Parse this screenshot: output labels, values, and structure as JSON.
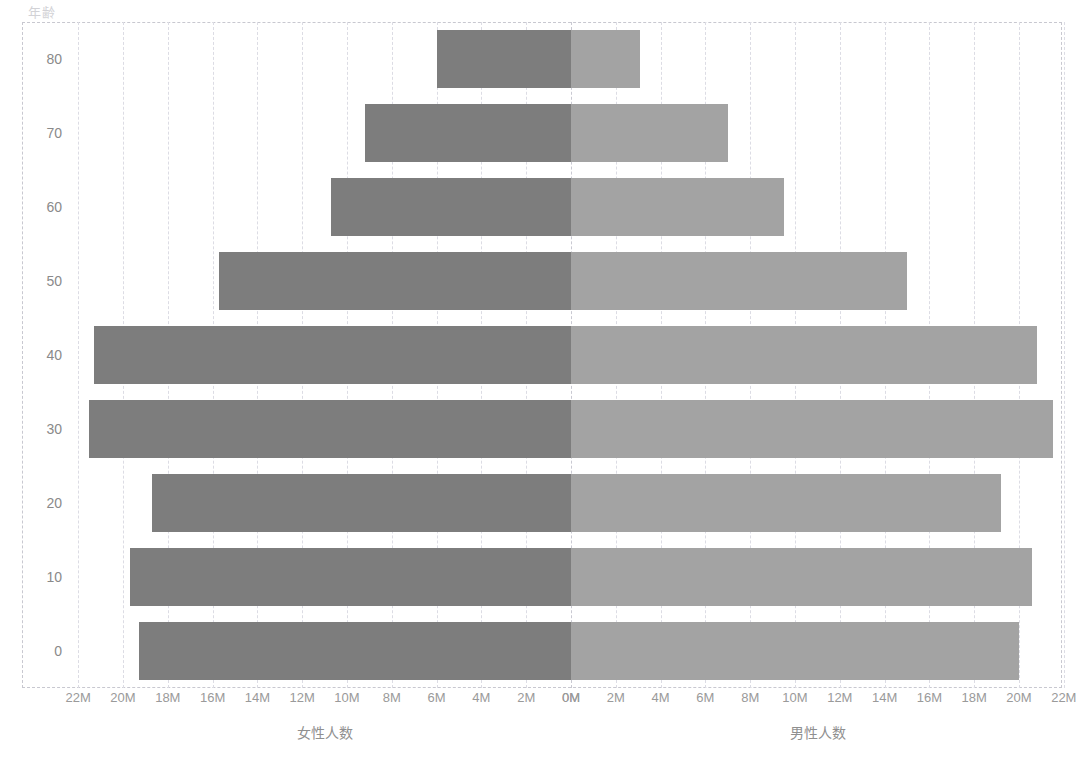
{
  "chart_data": {
    "type": "bar",
    "subtype": "population-pyramid",
    "title": "",
    "y_axis_title": "年齢",
    "categories": [
      0,
      10,
      20,
      30,
      40,
      50,
      60,
      70,
      80
    ],
    "category_tick_labels": [
      "0",
      "10",
      "20",
      "30",
      "40",
      "50",
      "60",
      "70",
      "80"
    ],
    "series": [
      {
        "name": "女性人数",
        "side": "left",
        "color": "#7d7d7d",
        "values": [
          19.3,
          19.7,
          18.7,
          21.5,
          21.3,
          15.7,
          10.7,
          9.2,
          6.0
        ]
      },
      {
        "name": "男性人数",
        "side": "right",
        "color": "#a3a3a3",
        "values": [
          20.0,
          20.6,
          19.2,
          21.5,
          20.8,
          15.0,
          9.5,
          7.0,
          3.1
        ]
      }
    ],
    "value_unit": "M",
    "xlim_left": [
      0,
      22
    ],
    "xlim_right": [
      0,
      22
    ],
    "ylim": [
      -5,
      85
    ],
    "x_tick_values_left": [
      22,
      20,
      18,
      16,
      14,
      12,
      10,
      8,
      6,
      4,
      2,
      0
    ],
    "x_tick_labels_left": [
      "22M",
      "20M",
      "18M",
      "16M",
      "14M",
      "12M",
      "10M",
      "8M",
      "6M",
      "4M",
      "2M",
      "0M"
    ],
    "x_tick_values_right": [
      0,
      2,
      4,
      6,
      8,
      10,
      12,
      14,
      16,
      18,
      20,
      22
    ],
    "x_tick_labels_right": [
      "0M",
      "2M",
      "4M",
      "6M",
      "8M",
      "10M",
      "12M",
      "14M",
      "16M",
      "18M",
      "20M",
      "22M"
    ],
    "xlabel_left": "女性人数",
    "xlabel_right": "男性人数",
    "grid": true,
    "grid_style": "dashed",
    "grid_color": "#dcdce4",
    "legend": "none",
    "background": "#ffffff"
  },
  "geometry": {
    "plot_left": 22,
    "plot_top": 22,
    "plot_right": 1062,
    "plot_bottom": 688,
    "center_x": 571,
    "px_per_million": 22.4,
    "bar_height": 58,
    "row_pitch": 74
  }
}
